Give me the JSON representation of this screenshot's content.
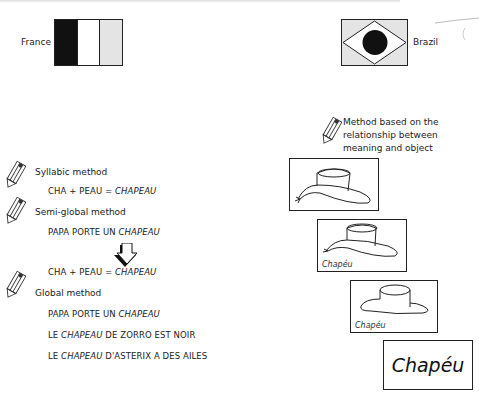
{
  "flags": {
    "france": {
      "label": "France",
      "stripe_colors": [
        "#111111",
        "#ffffff",
        "#e4e4e4"
      ]
    },
    "brazil": {
      "label": "Brazil",
      "background": "#e4e4e4",
      "diamond": "#ffffff",
      "circle": "#111111"
    }
  },
  "left_column": {
    "syllabic": {
      "title": "Syllabic method",
      "examples": [
        {
          "plain": "CHA + PEAU = ",
          "italic": "CHAPEAU"
        }
      ]
    },
    "semi_global": {
      "title": "Semi-global method",
      "examples": [
        {
          "plain": "PAPA PORTE UN ",
          "italic": "CHAPEAU"
        }
      ]
    },
    "transition": {
      "arrow_icon": "down-arrow-icon",
      "examples": [
        {
          "plain": "CHA + PEAU = ",
          "italic": "CHAPEAU"
        }
      ]
    },
    "global": {
      "title": "Global method",
      "examples": [
        {
          "prefix": "PAPA PORTE UN ",
          "italic": "CHAPEAU",
          "suffix": ""
        },
        {
          "prefix": "LE ",
          "italic": "CHAPEAU",
          "suffix": " DE ZORRO EST NOIR"
        },
        {
          "prefix": "LE ",
          "italic": "CHAPEAU",
          "suffix": " D'ASTERIX A DES AILES"
        }
      ]
    }
  },
  "right_column": {
    "method_title_lines": [
      "Method based on the",
      "relationship between",
      "meaning and object"
    ],
    "cards": [
      {
        "type": "hat-drawing-detailed",
        "caption": ""
      },
      {
        "type": "hat-drawing-detailed",
        "caption": "Chapéu"
      },
      {
        "type": "hat-drawing-simple",
        "caption": "Chapéu"
      },
      {
        "type": "word-only",
        "caption": "Chapéu"
      }
    ]
  },
  "icons": [
    "pencil-icon",
    "down-arrow-icon",
    "hat-icon"
  ]
}
